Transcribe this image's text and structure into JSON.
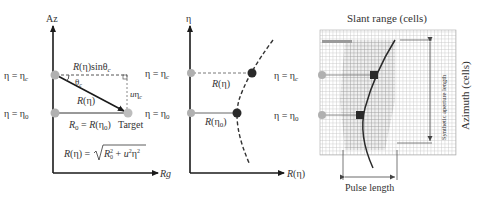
{
  "panel1": {
    "axis_y_label": "Az",
    "axis_x_label": "Rg",
    "eta_c_label": "η = η",
    "eta_c_sub": "c",
    "eta_0_label": "η = η",
    "eta_0_sub": "0",
    "top_label": "R(η)sinθ",
    "top_label_sub": "c",
    "theta_label": "θ",
    "theta_sub": "c",
    "side_label": "uη",
    "side_label_sub": "c",
    "hyp_label": "R(η)",
    "r0_label_a": "R",
    "r0_label_a_sub": "0",
    "r0_label_b": " = R(η",
    "r0_label_b_sub": "0",
    "r0_label_c": ")",
    "target_label": "Target",
    "formula_lhs": "R(η) = ",
    "formula_rhs": "R₀² + u²η²"
  },
  "panel2": {
    "axis_y_label": "η",
    "axis_x_label": "R(η)",
    "eta_c_label": "η = η",
    "eta_c_sub": "c",
    "eta_0_label": "η = η",
    "eta_0_sub": "0",
    "upper_label": "R(η)",
    "lower_label": "R(η",
    "lower_label_sub": "0",
    "lower_label_end": ")"
  },
  "panel3": {
    "title": "Slant range (cells)",
    "side_label": "Azimuth (cells)",
    "aperture_label": "Synthetic aperture length",
    "pulse_label": "Pulse length",
    "eta_c_label": "η = η",
    "eta_c_sub": "c",
    "eta_0_label": "η = η",
    "eta_0_sub": "0"
  },
  "colors": {
    "axis": "#1a1a1a",
    "text": "#333333",
    "point_light": "#b0b0b0",
    "point_dark": "#2a2a2a",
    "grid": "#bfbfbf"
  }
}
